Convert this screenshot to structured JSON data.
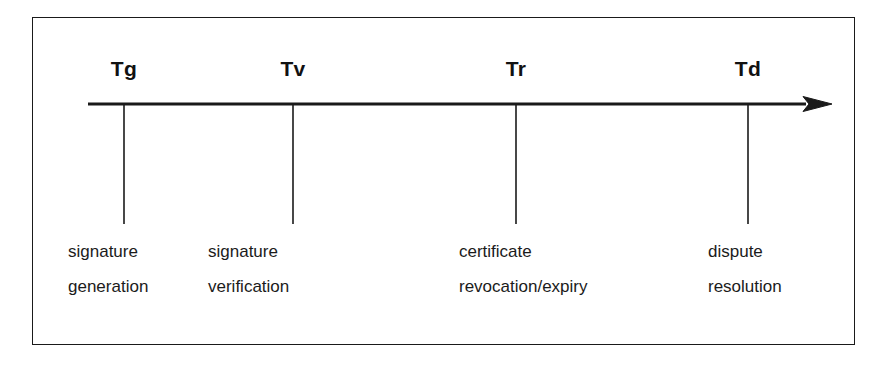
{
  "figure": {
    "type": "timeline-diagram",
    "background_color": "#ffffff",
    "line_color": "#1a1a1a",
    "text_color": "#1b1b1b",
    "axis": {
      "name": "time-axis",
      "direction": "left-to-right",
      "has_arrowhead": true,
      "start_x": 88,
      "end_x": 832,
      "y": 104
    },
    "events": [
      {
        "marker": "Tg",
        "marker_x": 124,
        "caption_x": 68,
        "caption_lines": [
          "signature",
          "generation"
        ]
      },
      {
        "marker": "Tv",
        "marker_x": 293,
        "caption_x": 208,
        "caption_lines": [
          "signature",
          "verification"
        ]
      },
      {
        "marker": "Tr",
        "marker_x": 516,
        "caption_x": 459,
        "caption_lines": [
          "certificate",
          "revocation/expiry"
        ]
      },
      {
        "marker": "Td",
        "marker_x": 748,
        "caption_x": 708,
        "caption_lines": [
          "dispute",
          "resolution"
        ]
      }
    ]
  }
}
